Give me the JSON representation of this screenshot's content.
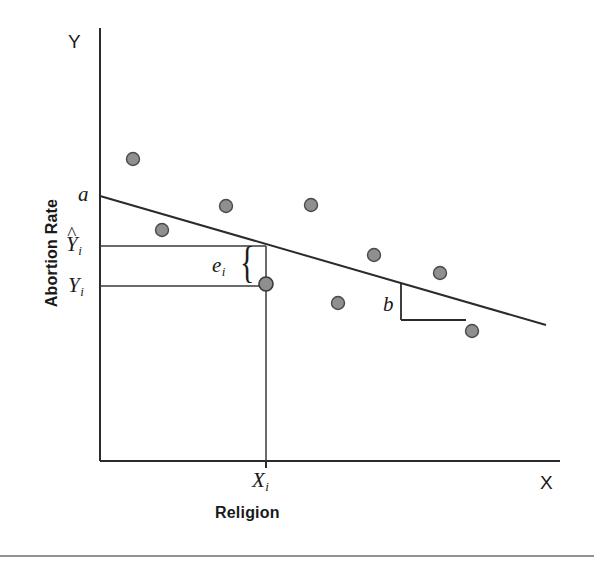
{
  "figure": {
    "type": "scatter-regression-diagram",
    "axes": {
      "y_letter": "Y",
      "x_letter": "X",
      "y_caption": "Abortion Rate",
      "x_caption": "Religion"
    },
    "labels": {
      "intercept": "a",
      "predicted_y": "Y",
      "predicted_y_sub": "i",
      "predicted_y_hat": "^",
      "observed_y": "Y",
      "observed_y_sub": "i",
      "x_value": "X",
      "x_value_sub": "i",
      "residual": "e",
      "residual_sub": "i",
      "slope": "b",
      "brace": "{"
    },
    "colors": {
      "point_fill": "#8f8f8f",
      "point_stroke": "#4a4a4a",
      "line": "#2b2b2b",
      "axis": "#2b2b2b",
      "text": "#1a1a1a",
      "rule": "#6e6e6e"
    }
  },
  "chart_data": {
    "type": "scatter",
    "title": "",
    "xlabel": "Religion",
    "ylabel": "Abortion Rate",
    "legend": [],
    "grid": false,
    "axis_letters": {
      "x": "X",
      "y": "Y"
    },
    "xlim": [
      100,
      560
    ],
    "ylim": [
      461,
      28
    ],
    "points": [
      {
        "px": 133,
        "py": 159
      },
      {
        "px": 162,
        "py": 230
      },
      {
        "px": 226,
        "py": 206
      },
      {
        "px": 311,
        "py": 205
      },
      {
        "px": 266,
        "py": 284
      },
      {
        "px": 338,
        "py": 303
      },
      {
        "px": 374,
        "py": 255
      },
      {
        "px": 440,
        "py": 273
      },
      {
        "px": 472,
        "py": 331
      }
    ],
    "regression_line": {
      "x1": 100,
      "y1": 196,
      "x2": 546,
      "y2": 325,
      "slope_sign": "negative",
      "intercept_label": "a",
      "slope_label": "b"
    },
    "highlighted_point": {
      "px": 266,
      "py": 284,
      "label_x": "X_i",
      "label_y": "Y_i"
    },
    "predicted_value_line_y": 246,
    "observed_value_line_y": 286,
    "residual_segment": {
      "x": 266,
      "y_top": 246,
      "y_bottom": 285,
      "label": "e_i"
    },
    "slope_triangle": {
      "vertex_x": 401,
      "vertex_y_top": 283,
      "vertex_y_bottom": 320,
      "run_x_end": 466,
      "run_y": 320
    },
    "annotations": [
      "a = y-intercept of regression line",
      "b = slope of regression line",
      "e_i = residual (observed minus predicted)",
      "Y-hat_i = predicted value",
      "Y_i = observed value",
      "X_i = observed predictor value"
    ]
  }
}
